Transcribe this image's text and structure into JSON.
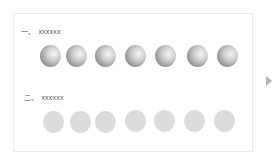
{
  "sections": [
    {
      "number": "一、",
      "label": "xxxxxx",
      "style": "shaded",
      "circle_count": 7
    },
    {
      "number": "二、",
      "label": "xxxxxx",
      "style": "flat",
      "circle_count": 7
    }
  ],
  "colors": {
    "panel_border": "#ececec",
    "shaded_circle_dark": "#6e6e6e",
    "shaded_circle_light": "#f4f4f4",
    "flat_circle": "#dcdcdc",
    "arrow": "#b5b5b5"
  },
  "icons": {
    "next": "triangle-right-icon"
  }
}
